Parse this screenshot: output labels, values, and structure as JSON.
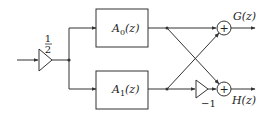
{
  "diagram": {
    "type": "signal-flow block diagram",
    "input_gain": {
      "numerator": "1",
      "denominator": "2"
    },
    "blocks": [
      {
        "id": "A0",
        "label_main": "A",
        "label_sub": "0",
        "label_arg": "(z)"
      },
      {
        "id": "A1",
        "label_main": "A",
        "label_sub": "1",
        "label_arg": "(z)"
      }
    ],
    "inverter_gain": "−1",
    "adders": [
      {
        "id": "sum-top",
        "symbol": "+"
      },
      {
        "id": "sum-bottom",
        "symbol": "+"
      }
    ],
    "outputs": [
      {
        "id": "G",
        "label": "G(z)"
      },
      {
        "id": "H",
        "label": "H(z)"
      }
    ],
    "colors": {
      "stroke": "#333333",
      "background": "#ffffff"
    }
  }
}
